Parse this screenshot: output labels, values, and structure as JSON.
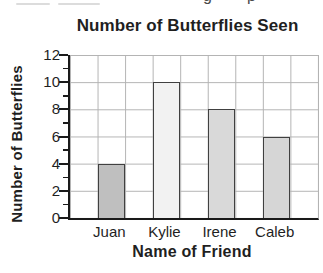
{
  "page": {
    "cropped_top_text_fragments": [
      "g",
      "p"
    ]
  },
  "chart_data": {
    "type": "bar",
    "title": "Number of Butterflies Seen",
    "xlabel": "Name of Friend",
    "ylabel": "Number of Butterflies",
    "categories": [
      "Juan",
      "Kylie",
      "Irene",
      "Caleb"
    ],
    "values": [
      4,
      10,
      8,
      6
    ],
    "bar_colors": [
      "#bfbfbf",
      "#f2f2f2",
      "#d9d9d9",
      "#d6d6d6"
    ],
    "bar_border_color": "#404040",
    "ylim": [
      0,
      12
    ],
    "yticks": [
      0,
      2,
      4,
      6,
      8,
      10,
      12
    ],
    "minor_tick_interval": 1,
    "grid": "on",
    "gridline_color": "#b3b3b3",
    "legend": "none"
  }
}
